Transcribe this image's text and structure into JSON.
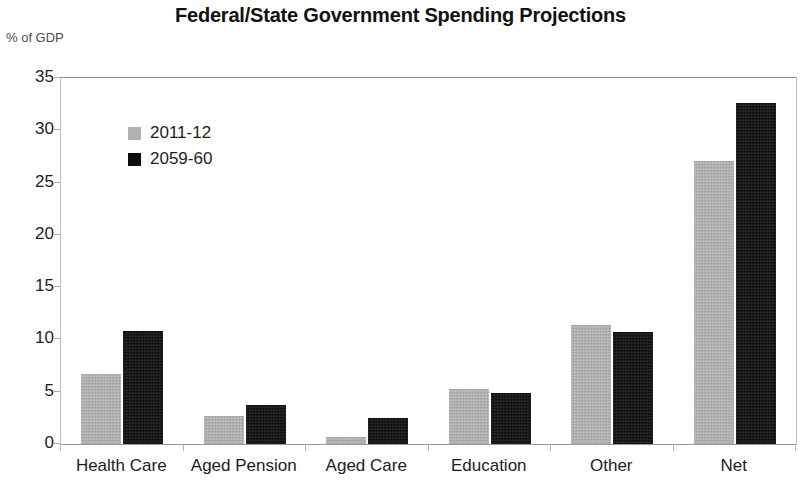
{
  "chart_data": {
    "type": "bar",
    "title": "Federal/State Government Spending Projections",
    "ylabel": "% of GDP",
    "xlabel": "",
    "categories": [
      "Health Care",
      "Aged Pension",
      "Aged Care",
      "Education",
      "Other",
      "Net"
    ],
    "series": [
      {
        "name": "2011-12",
        "color": "#b2b2b2",
        "values": [
          6.7,
          2.7,
          0.7,
          5.3,
          11.4,
          27.1
        ]
      },
      {
        "name": "2059-60",
        "color": "#0c0c0c",
        "values": [
          10.8,
          3.7,
          2.5,
          4.9,
          10.7,
          32.6
        ]
      }
    ],
    "ylim": [
      0,
      35
    ],
    "yticks": [
      0,
      5,
      10,
      15,
      20,
      25,
      30,
      35
    ],
    "ytick_labels": [
      "0",
      "5",
      "10",
      "15",
      "20",
      "25",
      "30",
      "35"
    ],
    "grid": false,
    "legend_position": "upper-left-inside",
    "plot_border": true,
    "background_color": "#ffffff"
  }
}
